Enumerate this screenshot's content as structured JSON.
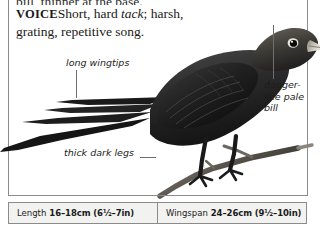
{
  "page": {
    "background_color": "#ffffff",
    "rule_color": "#8b8b8b"
  },
  "voice": {
    "truncated_line": "bill, thinner at the base.",
    "keyword": "VOICE",
    "line1_a": "Short, hard ",
    "line1_italic": "tack",
    "line1_b": "; harsh,",
    "line2": "grating, repetitive song."
  },
  "callouts": [
    {
      "name": "long-wingtips",
      "text": "long wingtips"
    },
    {
      "name": "dagger-like-pale-bill",
      "text": "dagger-\nlike pale\nbill"
    },
    {
      "name": "thick-dark-legs",
      "text": "thick dark legs"
    }
  ],
  "measurements": {
    "length": {
      "label": "Length",
      "value": "16–18cm (6½–7in)"
    },
    "wingspan": {
      "label": "Wingspan",
      "value": "24–26cm (9½–10in)"
    }
  },
  "illustration": {
    "subject": "perching-bird",
    "plumage_color": "#262626",
    "bill_color": "#b8b2a6",
    "branch_color": "#4a4640"
  }
}
